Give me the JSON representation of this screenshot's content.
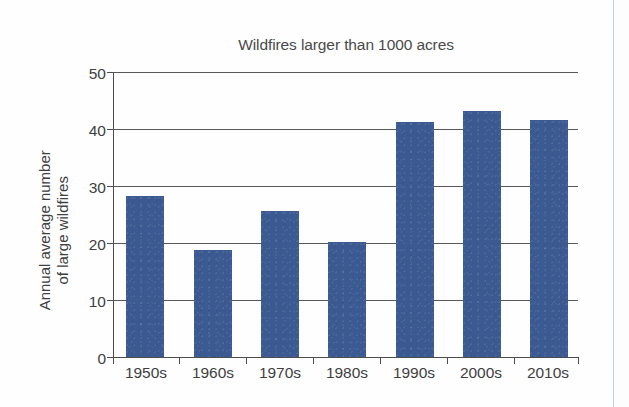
{
  "chart_data": {
    "type": "bar",
    "title": "Wildfires larger than 1000 acres",
    "xlabel": "",
    "ylabel": "Annual average number of large wildfires",
    "ylabel_lines": [
      "Annual average number",
      "of large wildfires"
    ],
    "categories": [
      "1950s",
      "1960s",
      "1970s",
      "1980s",
      "1990s",
      "2000s",
      "2010s"
    ],
    "values": [
      28.2,
      18.8,
      25.6,
      20.2,
      41.3,
      43.1,
      41.6
    ],
    "series": [
      {
        "name": "Annual average number of large wildfires",
        "values": [
          28.2,
          18.8,
          25.6,
          20.2,
          41.3,
          43.1,
          41.6
        ]
      }
    ],
    "ylim": [
      0,
      50
    ],
    "yticks": [
      0,
      10,
      20,
      30,
      40,
      50
    ],
    "ytick_labels": [
      "0",
      "10",
      "20",
      "30",
      "40",
      "50"
    ],
    "grid": true,
    "grid_axis": "y",
    "legend": false,
    "legend_position": "none",
    "bar_color": "#3c5a92",
    "axis_color": "#4d4d4d",
    "text_color": "#3f3f3f"
  }
}
